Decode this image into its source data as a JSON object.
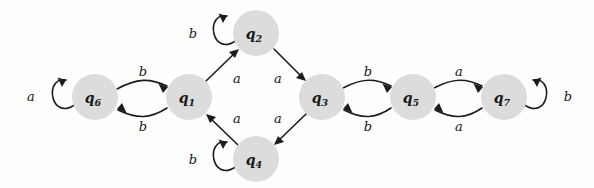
{
  "diagram": {
    "type": "finite-state-machine",
    "alphabet": [
      "a",
      "b"
    ],
    "background_color": "#fefefe",
    "node_fill_color": "#dcdcdc",
    "edge_color": "#1c1c1c",
    "states": [
      {
        "id": "q6",
        "label": "q",
        "sub": "6",
        "cx": 95,
        "cy": 97,
        "r": 23
      },
      {
        "id": "q1",
        "label": "q",
        "sub": "1",
        "cx": 189,
        "cy": 97,
        "r": 23
      },
      {
        "id": "q2",
        "label": "q",
        "sub": "2",
        "cx": 256,
        "cy": 33,
        "r": 23
      },
      {
        "id": "q4",
        "label": "q",
        "sub": "4",
        "cx": 256,
        "cy": 159,
        "r": 23
      },
      {
        "id": "q3",
        "label": "q",
        "sub": "3",
        "cx": 322,
        "cy": 97,
        "r": 23
      },
      {
        "id": "q5",
        "label": "q",
        "sub": "5",
        "cx": 413,
        "cy": 97,
        "r": 23
      },
      {
        "id": "q7",
        "label": "q",
        "sub": "7",
        "cx": 504,
        "cy": 97,
        "r": 23
      }
    ],
    "transitions": [
      {
        "from": "q6",
        "to": "q6",
        "symbol": "a",
        "kind": "self-loop",
        "label_x": 31,
        "label_y": 96
      },
      {
        "from": "q6",
        "to": "q1",
        "symbol": "b",
        "kind": "curve-top",
        "label_x": 143,
        "label_y": 71
      },
      {
        "from": "q1",
        "to": "q6",
        "symbol": "b",
        "kind": "curve-bottom",
        "label_x": 143,
        "label_y": 126
      },
      {
        "from": "q1",
        "to": "q2",
        "symbol": "a",
        "kind": "diagonal",
        "label_x": 237,
        "label_y": 78
      },
      {
        "from": "q2",
        "to": "q2",
        "symbol": "b",
        "kind": "self-loop",
        "label_x": 193,
        "label_y": 33
      },
      {
        "from": "q2",
        "to": "q3",
        "symbol": "a",
        "kind": "diagonal",
        "label_x": 278,
        "label_y": 78
      },
      {
        "from": "q3",
        "to": "q4",
        "symbol": "a",
        "kind": "diagonal",
        "label_x": 278,
        "label_y": 118
      },
      {
        "from": "q4",
        "to": "q4",
        "symbol": "b",
        "kind": "self-loop",
        "label_x": 193,
        "label_y": 159
      },
      {
        "from": "q4",
        "to": "q1",
        "symbol": "a",
        "kind": "diagonal",
        "label_x": 237,
        "label_y": 118
      },
      {
        "from": "q3",
        "to": "q5",
        "symbol": "b",
        "kind": "curve-top",
        "label_x": 368,
        "label_y": 71
      },
      {
        "from": "q5",
        "to": "q3",
        "symbol": "b",
        "kind": "curve-bottom",
        "label_x": 368,
        "label_y": 126
      },
      {
        "from": "q5",
        "to": "q7",
        "symbol": "a",
        "kind": "curve-top",
        "label_x": 459,
        "label_y": 71
      },
      {
        "from": "q7",
        "to": "q5",
        "symbol": "a",
        "kind": "curve-bottom",
        "label_x": 459,
        "label_y": 126
      },
      {
        "from": "q7",
        "to": "q7",
        "symbol": "b",
        "kind": "self-loop",
        "label_x": 568,
        "label_y": 96
      }
    ]
  }
}
